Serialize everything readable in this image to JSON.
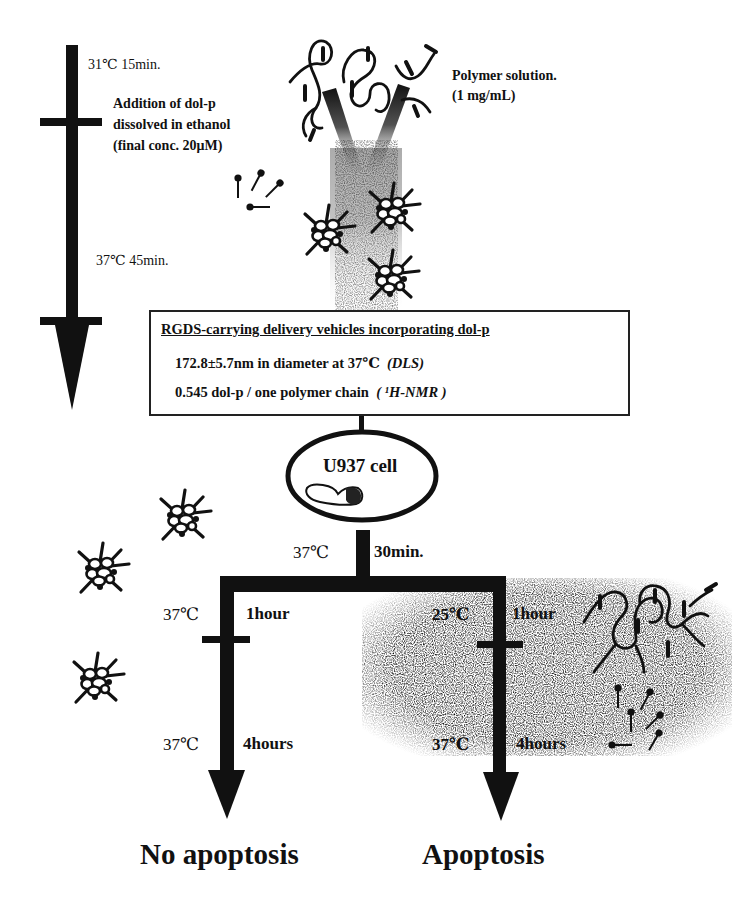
{
  "preparation": {
    "step1": "31℃ 15min.",
    "addition": {
      "line1": "Addition of dol-p",
      "line2": "dissolved in ethanol",
      "line3": "(final conc. 20μM)"
    },
    "step2": "37℃ 45min.",
    "polymer_solution": {
      "line1": "Polymer solution.",
      "line2": "(1 mg/mL)"
    }
  },
  "vehicle_box": {
    "title": "RGDS-carrying delivery vehicles incorporating dol-p",
    "diameter": "172.8±5.7nm in diameter at 37℃",
    "diameter_method": "(DLS)",
    "ratio": "0.545 dol-p / one polymer chain",
    "ratio_method": "( ¹H-NMR )"
  },
  "cell": {
    "label": "U937 cell",
    "incubation_temp": "37℃",
    "incubation_time": "30min."
  },
  "branches": {
    "left": {
      "temp1": "37℃",
      "time1": "1hour",
      "temp2": "37℃",
      "time2": "4hours",
      "outcome": "No apoptosis"
    },
    "right": {
      "temp1": "25℃",
      "time1": "1hour",
      "temp2": "37℃",
      "time2": "4hours",
      "outcome": "Apoptosis"
    }
  },
  "icons": {
    "micelle": "spiky-micelle-icon",
    "lipid": "dol-p-lipid-icon",
    "polymer": "polymer-chain-icon"
  },
  "colors": {
    "ink": "#111111",
    "speckle_bg": "#d8d8d8",
    "background": "#ffffff"
  }
}
